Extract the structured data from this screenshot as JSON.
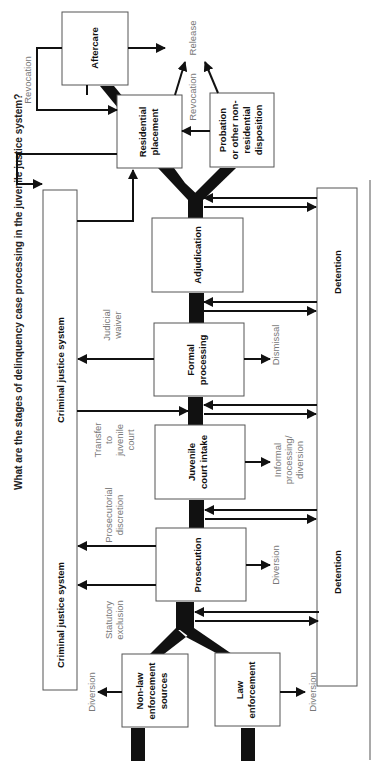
{
  "title": "What are the stages of delinquency case processing in the juvenile justice system?",
  "nodes": {
    "aftercare": "Aftercare",
    "residential_placement": [
      "Residential",
      "placement"
    ],
    "probation": [
      "Probation",
      "or other non-",
      "residential",
      "disposition"
    ],
    "adjudication": "Adjudication",
    "formal_processing": [
      "Formal",
      "processing"
    ],
    "juvenile_court_intake": [
      "Juvenile",
      "court intake"
    ],
    "prosecution": "Prosecution",
    "non_law_enforcement": [
      "Non-law",
      "enforcement",
      "sources"
    ],
    "law_enforcement": [
      "Law",
      "enforcement"
    ],
    "criminal_justice_system_1": "Criminal justice system",
    "criminal_justice_system_2": "Criminal justice system",
    "detention_1": "Detention",
    "detention_2": "Detention"
  },
  "edge_labels": {
    "revocation_aftercare": "Revocation",
    "release": "Release",
    "revocation_probation": "Revocation",
    "judicial_waiver": [
      "Judicial",
      "waiver"
    ],
    "dismissal": "Dismissal",
    "transfer_to_juvenile_court": [
      "Transfer",
      "to",
      "juvenile",
      "court"
    ],
    "informal_processing": [
      "Informal",
      "processing/",
      "diversion"
    ],
    "prosecutorial_discretion": [
      "Prosecutorial",
      "discretion"
    ],
    "diversion_prosecution": "Diversion",
    "statutory_exclusion": [
      "Statutory",
      "exclusion"
    ],
    "diversion_nonlaw": "Diversion",
    "diversion_law": "Diversion"
  }
}
